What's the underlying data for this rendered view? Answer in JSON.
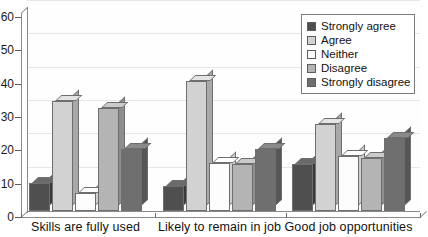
{
  "chart_data": {
    "type": "bar",
    "title": "",
    "xlabel": "",
    "ylabel": "",
    "ylim": [
      0,
      60
    ],
    "yticks": [
      0,
      10,
      20,
      30,
      40,
      50,
      60
    ],
    "grid": true,
    "legend_position": "top-right",
    "style": "3d-clustered-column",
    "categories": [
      "Skills are fully used",
      "Likely to remain in job",
      "Good job opportunities"
    ],
    "series": [
      {
        "name": "Strongly agree",
        "color": "#4f4f4f",
        "top_color": "#6a6a6a",
        "side_color": "#3a3a3a",
        "values": [
          8.5,
          7.5,
          14
        ]
      },
      {
        "name": "Agree",
        "color": "#d2d2d2",
        "top_color": "#e4e4e4",
        "side_color": "#a8a8a8",
        "values": [
          33,
          39,
          26
        ]
      },
      {
        "name": "Neither",
        "color": "#fdfdfd",
        "top_color": "#ffffff",
        "side_color": "#d0d0d0",
        "values": [
          5.5,
          14.5,
          16.5
        ]
      },
      {
        "name": "Disagree",
        "color": "#b4b4b4",
        "top_color": "#cacaca",
        "side_color": "#8e8e8e",
        "values": [
          31,
          14,
          16
        ]
      },
      {
        "name": "Strongly disagree",
        "color": "#6f6f6f",
        "top_color": "#8a8a8a",
        "side_color": "#565656",
        "values": [
          18.5,
          18.5,
          22
        ]
      }
    ]
  },
  "legend": {
    "items": [
      {
        "label": "Strongly agree"
      },
      {
        "label": "Agree"
      },
      {
        "label": "Neither"
      },
      {
        "label": "Disagree"
      },
      {
        "label": "Strongly disagree"
      }
    ]
  },
  "axis": {
    "y_tick_labels": [
      "60",
      "50",
      "40",
      "30",
      "20",
      "10",
      "0"
    ]
  }
}
